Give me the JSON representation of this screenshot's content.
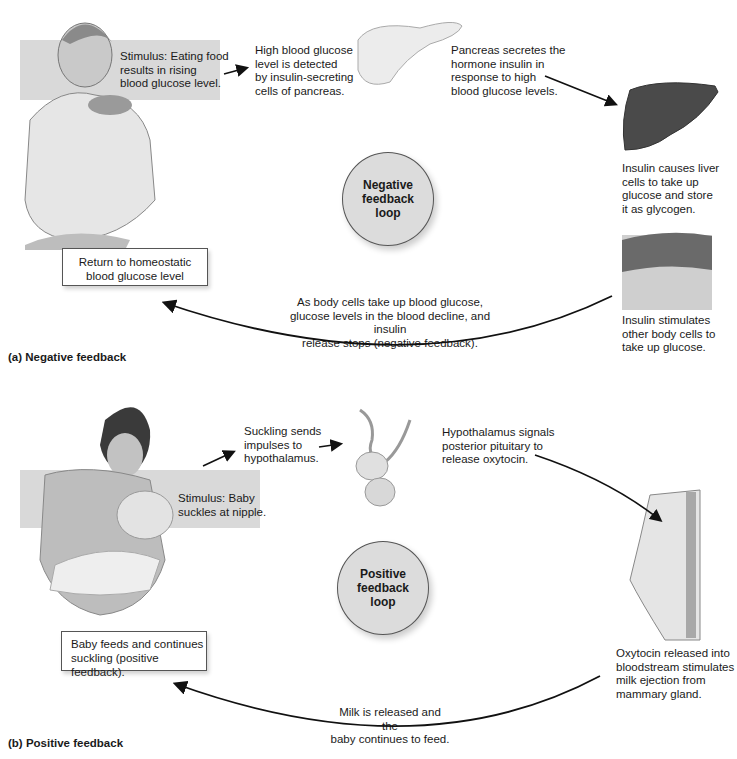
{
  "panel_a": {
    "label": "(a) Negative feedback",
    "stimulus": [
      "Stimulus: Eating food",
      "results in rising",
      "blood glucose level."
    ],
    "detect": [
      "High blood glucose",
      "level is detected",
      "by insulin-secreting",
      "cells of pancreas."
    ],
    "pancreas": [
      "Pancreas secretes the",
      "hormone insulin in",
      "response to high",
      "blood glucose levels."
    ],
    "liver": [
      "Insulin causes liver",
      "cells to take up",
      "glucose and store",
      "it as glycogen."
    ],
    "cells": [
      "Insulin stimulates",
      "other body cells to",
      "take up glucose."
    ],
    "return_arrow_text": [
      "As body cells take up blood glucose,",
      "glucose levels in the blood decline, and insulin",
      "release stops (negative feedback)."
    ],
    "result_box": [
      "Return to homeostatic",
      "blood glucose level"
    ],
    "loop": [
      "Negative",
      "feedback",
      "loop"
    ],
    "illustrations": [
      "person-eating",
      "pancreas",
      "liver",
      "body-tissue"
    ]
  },
  "panel_b": {
    "label": "(b) Positive feedback",
    "stimulus": [
      "Stimulus: Baby",
      "suckles at nipple."
    ],
    "impulse": [
      "Suckling sends",
      "impulses to",
      "hypothalamus."
    ],
    "hypothalamus": [
      "Hypothalamus signals",
      "posterior pituitary to",
      "release oxytocin."
    ],
    "oxytocin": [
      "Oxytocin released into",
      "bloodstream stimulates",
      "milk ejection from",
      "mammary gland."
    ],
    "return_arrow_text": [
      "Milk is released and the",
      "baby continues to feed."
    ],
    "result_box": [
      "Baby feeds and continues",
      "suckling (positive feedback)."
    ],
    "loop": [
      "Positive",
      "feedback",
      "loop"
    ],
    "illustrations": [
      "mother-nursing-baby",
      "pituitary-gland",
      "mammary-gland"
    ]
  },
  "colors": {
    "band": "#d9d9d9",
    "loop_fill": "#dcdcdc",
    "text": "#1a1a1a",
    "liver": "#4a4a4a"
  }
}
